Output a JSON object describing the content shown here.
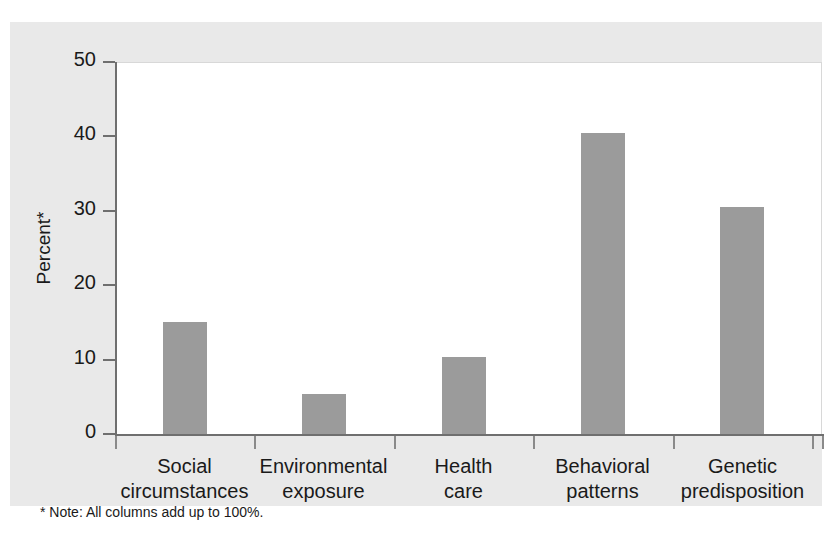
{
  "chart_data": {
    "type": "bar",
    "title": "",
    "subtitle": "",
    "xlabel": "",
    "ylabel": "Percent*",
    "ylim": [
      0,
      50
    ],
    "yticks": [
      0,
      10,
      20,
      30,
      40,
      50
    ],
    "ytick_labels": [
      "0",
      "10",
      "20",
      "30",
      "40",
      "50"
    ],
    "grid": false,
    "legend": null,
    "categories": [
      "Social circumstances",
      "Environmental exposure",
      "Health care",
      "Behavioral patterns",
      "Genetic predisposition"
    ],
    "category_lines": [
      [
        "Social",
        "circumstances"
      ],
      [
        "Environmental",
        "exposure"
      ],
      [
        "Health",
        "care"
      ],
      [
        "Behavioral",
        "patterns"
      ],
      [
        "Genetic",
        "predisposition"
      ]
    ],
    "values": [
      15,
      5.4,
      10.3,
      40.5,
      30.5
    ],
    "bar_color": "#9b9b9b",
    "annotations": [
      "* Note: All columns add up to 100%."
    ]
  },
  "footnote": "* Note: All columns add up to 100%.",
  "axis": {
    "y_title": "Percent*"
  },
  "colors": {
    "panel_background": "#e9e9e9",
    "plot_background": "#ffffff",
    "bar_fill": "#9b9b9b",
    "axis_line": "#6f6f6f",
    "text": "#1a1a1a"
  }
}
